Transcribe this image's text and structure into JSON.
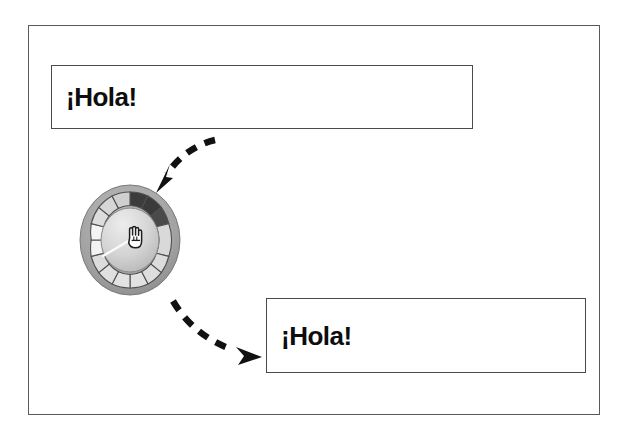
{
  "figure": {
    "background_color": "#ffffff",
    "frame_border_color": "#5a5a5a"
  },
  "text_boxes": [
    {
      "id": "text-box-top",
      "name": "source-text-box",
      "value": "¡Hola!",
      "placeholder": "¡Hola!",
      "border_color": "#4a4a4a",
      "text_color": "#0d0d0d"
    },
    {
      "id": "text-box-bottom",
      "name": "result-text-box",
      "value": "¡Hola!",
      "placeholder": "¡Hola!",
      "border_color": "#4a4a4a",
      "text_color": "#0d0d0d"
    }
  ],
  "knob": {
    "name": "rotary-knob",
    "segment_count": 16,
    "highlighted_segments": 3,
    "highlight_color": "#3a3a3a",
    "segment_fill": "#d8d8d8",
    "segment_stroke": "#555555",
    "ring_color": "#9a9a9a",
    "face_color": "#cfcfcf",
    "indicator_color": "#f2f2f2",
    "cursor_icon": "hand-pointer-icon"
  },
  "arrows": [
    {
      "name": "arrow-to-knob",
      "style": "dashed-curved",
      "direction": "down-left",
      "color": "#111111"
    },
    {
      "name": "arrow-to-result",
      "style": "dashed-curved",
      "direction": "down-right",
      "color": "#111111"
    }
  ]
}
